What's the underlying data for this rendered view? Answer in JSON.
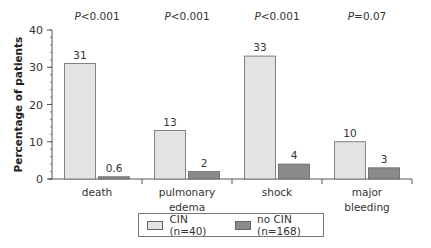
{
  "chart_data": {
    "type": "bar",
    "title": "",
    "xlabel": "",
    "ylabel": "Percentage of patients",
    "ylim": [
      0,
      40
    ],
    "yticks": [
      0,
      10,
      20,
      30,
      40
    ],
    "grid": false,
    "legend_position": "bottom",
    "categories": [
      "death",
      "pulmonary edema",
      "shock",
      "major bleeding"
    ],
    "category_lines": [
      [
        "death"
      ],
      [
        "pulmonary",
        "edema"
      ],
      [
        "shock"
      ],
      [
        "major",
        "bleeding"
      ]
    ],
    "p_values": [
      "P<0.001",
      "P<0.001",
      "P<0.001",
      "P=0.07"
    ],
    "series": [
      {
        "name": "CIN (n=40)",
        "values": [
          31,
          13,
          33,
          10
        ],
        "labels": [
          "31",
          "13",
          "33",
          "10"
        ],
        "color": "#e3e3e3"
      },
      {
        "name": "no CIN (n=168)",
        "values": [
          0.6,
          2,
          4,
          3
        ],
        "labels": [
          "0.6",
          "2",
          "4",
          "3"
        ],
        "color": "#8a8a8a"
      }
    ]
  },
  "legend": {
    "items": [
      {
        "label": "CIN (n=40)",
        "color": "#e3e3e3"
      },
      {
        "label": "no CIN (n=168)",
        "color": "#8a8a8a"
      }
    ]
  }
}
